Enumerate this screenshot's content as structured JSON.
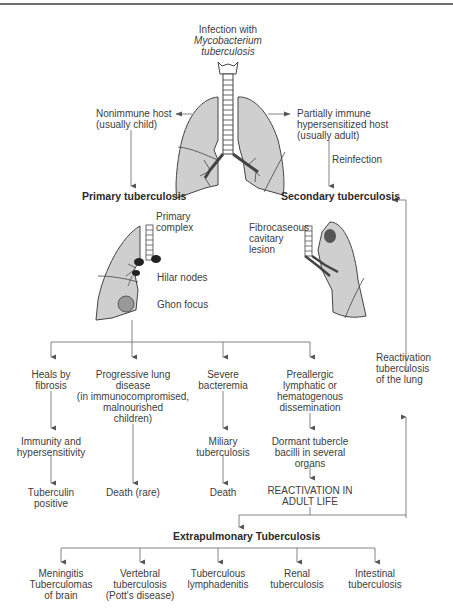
{
  "title": {
    "line1": "Infection with",
    "line2": "Mycobacterium",
    "line3": "tuberculosis"
  },
  "hosts": {
    "nonimmune": {
      "line1": "Nonimmune host",
      "line2": "(usually child)"
    },
    "partial": {
      "line1": "Partially immune",
      "line2": "hypersensitized host",
      "line3": "(usually adult)"
    },
    "reinfection": "Reinfection"
  },
  "primary": {
    "title": "Primary tuberculosis",
    "complex": {
      "line1": "Primary",
      "line2": "complex"
    },
    "hilar": "Hilar nodes",
    "ghon": "Ghon focus"
  },
  "secondary": {
    "title": "Secondary tuberculosis",
    "lesion": {
      "line1": "Fibrocaseous",
      "line2": "cavitary",
      "line3": "lesion"
    }
  },
  "reactivation_lung": {
    "line1": "Reactivation",
    "line2": "tuberculosis",
    "line3": "of the lung"
  },
  "outcomes": [
    {
      "lines": [
        "Heals by",
        "fibrosis"
      ],
      "next": [
        "Immunity and",
        "hypersensitivity"
      ],
      "final": [
        "Tuberculin",
        "positive"
      ]
    },
    {
      "lines": [
        "Progressive lung",
        "disease",
        "(in immunocompromised,",
        "malnourished",
        "children)"
      ],
      "final": [
        "Death (rare)"
      ]
    },
    {
      "lines": [
        "Severe",
        "bacteremia"
      ],
      "next": [
        "Miliary",
        "tuberculosis"
      ],
      "final": [
        "Death"
      ]
    },
    {
      "lines": [
        "Preallergic",
        "lymphatic or",
        "hematogenous",
        "dissemination"
      ],
      "next": [
        "Dormant tubercle",
        "bacilli in several",
        "organs"
      ],
      "final": [
        "REACTIVATION IN",
        "ADULT LIFE"
      ]
    }
  ],
  "extrapulmonary": {
    "title": "Extrapulmonary Tuberculosis",
    "items": [
      [
        "Meningitis",
        "Tuberculomas",
        "of brain"
      ],
      [
        "Vertebral",
        "tuberculosis",
        "(Pott's disease)"
      ],
      [
        "Tuberculous",
        "lymphadenitis"
      ],
      [
        "Renal",
        "tuberculosis"
      ],
      [
        "Intestinal",
        "tuberculosis"
      ]
    ]
  },
  "colors": {
    "line": "#6a6a6a",
    "lung_fill": "#cfcfcf",
    "text": "#3d3d3d"
  }
}
